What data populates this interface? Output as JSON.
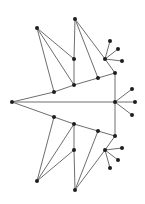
{
  "diagram": {
    "type": "graph",
    "title": "",
    "colors": {
      "edge": "#6e6e6e",
      "node": "#1e1e1e",
      "background": "#ffffff"
    },
    "node_radius": 2,
    "nodes": [
      {
        "id": "n0",
        "x": 12,
        "y": 102
      },
      {
        "id": "n1",
        "x": 115,
        "y": 102
      },
      {
        "id": "n2",
        "x": 54,
        "y": 92
      },
      {
        "id": "n3",
        "x": 74,
        "y": 85
      },
      {
        "id": "n4",
        "x": 98,
        "y": 78
      },
      {
        "id": "n5",
        "x": 115,
        "y": 73
      },
      {
        "id": "n6",
        "x": 37,
        "y": 28
      },
      {
        "id": "n7",
        "x": 75,
        "y": 19
      },
      {
        "id": "n8",
        "x": 74,
        "y": 59
      },
      {
        "id": "n9",
        "x": 105,
        "y": 59
      },
      {
        "id": "n10",
        "x": 110,
        "y": 41
      },
      {
        "id": "n11",
        "x": 118,
        "y": 49
      },
      {
        "id": "n12",
        "x": 122,
        "y": 61
      },
      {
        "id": "n13",
        "x": 132,
        "y": 89
      },
      {
        "id": "n14",
        "x": 135,
        "y": 102
      },
      {
        "id": "n15",
        "x": 132,
        "y": 115
      },
      {
        "id": "n16",
        "x": 54,
        "y": 117
      },
      {
        "id": "n17",
        "x": 74,
        "y": 124
      },
      {
        "id": "n18",
        "x": 98,
        "y": 131
      },
      {
        "id": "n19",
        "x": 115,
        "y": 136
      },
      {
        "id": "n20",
        "x": 37,
        "y": 181
      },
      {
        "id": "n21",
        "x": 75,
        "y": 190
      },
      {
        "id": "n22",
        "x": 74,
        "y": 150
      },
      {
        "id": "n23",
        "x": 105,
        "y": 150
      },
      {
        "id": "n24",
        "x": 122,
        "y": 148
      },
      {
        "id": "n25",
        "x": 118,
        "y": 160
      },
      {
        "id": "n26",
        "x": 110,
        "y": 168
      }
    ],
    "edges": [
      [
        "n0",
        "n1"
      ],
      [
        "n0",
        "n2"
      ],
      [
        "n2",
        "n3"
      ],
      [
        "n3",
        "n4"
      ],
      [
        "n4",
        "n5"
      ],
      [
        "n5",
        "n1"
      ],
      [
        "n6",
        "n2"
      ],
      [
        "n6",
        "n3"
      ],
      [
        "n6",
        "n8"
      ],
      [
        "n7",
        "n8"
      ],
      [
        "n8",
        "n3"
      ],
      [
        "n7",
        "n4"
      ],
      [
        "n7",
        "n9"
      ],
      [
        "n9",
        "n5"
      ],
      [
        "n9",
        "n10"
      ],
      [
        "n9",
        "n11"
      ],
      [
        "n9",
        "n12"
      ],
      [
        "n1",
        "n13"
      ],
      [
        "n1",
        "n14"
      ],
      [
        "n1",
        "n15"
      ],
      [
        "n0",
        "n16"
      ],
      [
        "n16",
        "n17"
      ],
      [
        "n17",
        "n18"
      ],
      [
        "n18",
        "n19"
      ],
      [
        "n19",
        "n1"
      ],
      [
        "n20",
        "n16"
      ],
      [
        "n20",
        "n17"
      ],
      [
        "n20",
        "n22"
      ],
      [
        "n21",
        "n22"
      ],
      [
        "n22",
        "n17"
      ],
      [
        "n21",
        "n18"
      ],
      [
        "n21",
        "n23"
      ],
      [
        "n23",
        "n19"
      ],
      [
        "n23",
        "n24"
      ],
      [
        "n23",
        "n25"
      ],
      [
        "n23",
        "n26"
      ]
    ]
  }
}
